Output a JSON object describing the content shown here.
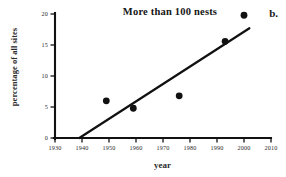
{
  "figure": {
    "panel_label": "b.",
    "title": "More than 100 nests"
  },
  "chart_data": {
    "type": "scatter",
    "title": "More than 100 nests",
    "xlabel": "year",
    "ylabel": "percentage of all sites",
    "xlim": [
      1930,
      2010
    ],
    "ylim": [
      0,
      20
    ],
    "grid": false,
    "legend": false,
    "xticks": [
      1930,
      1940,
      1950,
      1960,
      1970,
      1980,
      1990,
      2000,
      2010
    ],
    "xtick_labels": [
      "1930",
      "1940",
      "1950",
      "1960",
      "1970",
      "1980",
      "1990",
      "2000",
      "2010"
    ],
    "yticks": [
      0,
      5,
      10,
      15,
      20
    ],
    "ytick_labels": [
      "0",
      "5",
      "10",
      "15",
      "20"
    ],
    "series": [
      {
        "name": "percentage of all sites",
        "marker": "filled-circle",
        "points": [
          {
            "x": 1949,
            "y": 6.0
          },
          {
            "x": 1959,
            "y": 4.8
          },
          {
            "x": 1976,
            "y": 6.8
          },
          {
            "x": 1993,
            "y": 15.6
          },
          {
            "x": 2000,
            "y": 19.8
          }
        ]
      }
    ],
    "trend_line": {
      "name": "fitted regression line",
      "start": {
        "x": 1939,
        "y": 0.0
      },
      "end": {
        "x": 2002,
        "y": 17.7
      }
    }
  }
}
